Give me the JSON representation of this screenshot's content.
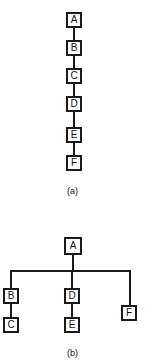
{
  "figure": {
    "background_color": "#ffffff",
    "stroke_color": "#1a1a1a",
    "text_color": "#111111",
    "panels": [
      {
        "id": "a",
        "caption": "(a)",
        "kind": "linear-chain",
        "nodes": [
          {
            "label": "A",
            "x": 66,
            "y": 12,
            "w": 16,
            "h": 16
          },
          {
            "label": "B",
            "x": 66,
            "y": 40,
            "w": 16,
            "h": 16
          },
          {
            "label": "C",
            "x": 66,
            "y": 68,
            "w": 16,
            "h": 16
          },
          {
            "label": "D",
            "x": 66,
            "y": 96,
            "w": 16,
            "h": 16
          },
          {
            "label": "E",
            "x": 66,
            "y": 127,
            "w": 16,
            "h": 16
          },
          {
            "label": "F",
            "x": 66,
            "y": 155,
            "w": 16,
            "h": 16
          }
        ],
        "edges": [
          {
            "from": "A",
            "to": "B",
            "orient": "v",
            "x": 73,
            "y": 28,
            "len": 12
          },
          {
            "from": "B",
            "to": "C",
            "orient": "v",
            "x": 73,
            "y": 56,
            "len": 12
          },
          {
            "from": "C",
            "to": "D",
            "orient": "v",
            "x": 73,
            "y": 84,
            "len": 12
          },
          {
            "from": "D",
            "to": "E",
            "orient": "v",
            "x": 73,
            "y": 112,
            "len": 15
          },
          {
            "from": "E",
            "to": "F",
            "orient": "v",
            "x": 73,
            "y": 143,
            "len": 12
          }
        ],
        "caption_x": 0,
        "caption_y": 186
      },
      {
        "id": "b",
        "caption": "(b)",
        "kind": "tree",
        "nodes": [
          {
            "label": "A",
            "x": 64,
            "y": 32,
            "w": 18,
            "h": 18
          },
          {
            "label": "B",
            "x": 3,
            "y": 83,
            "w": 16,
            "h": 16
          },
          {
            "label": "C",
            "x": 3,
            "y": 112,
            "w": 16,
            "h": 16
          },
          {
            "label": "D",
            "x": 64,
            "y": 83,
            "w": 16,
            "h": 16
          },
          {
            "label": "E",
            "x": 64,
            "y": 112,
            "w": 16,
            "h": 16
          },
          {
            "label": "F",
            "x": 121,
            "y": 100,
            "w": 16,
            "h": 16
          }
        ],
        "edges": [
          {
            "from": "A",
            "to": "bus",
            "orient": "v",
            "x": 72,
            "y": 50,
            "len": 16
          },
          {
            "from": "bus",
            "to": "bus",
            "orient": "h",
            "x": 10,
            "y": 65,
            "len": 121
          },
          {
            "from": "bus",
            "to": "B",
            "orient": "v",
            "x": 10,
            "y": 65,
            "len": 18
          },
          {
            "from": "bus",
            "to": "D",
            "orient": "v",
            "x": 71,
            "y": 65,
            "len": 18
          },
          {
            "from": "bus",
            "to": "F",
            "orient": "v",
            "x": 129,
            "y": 65,
            "len": 35
          },
          {
            "from": "B",
            "to": "C",
            "orient": "v",
            "x": 10,
            "y": 99,
            "len": 13
          },
          {
            "from": "D",
            "to": "E",
            "orient": "v",
            "x": 71,
            "y": 99,
            "len": 13
          }
        ],
        "caption_x": 0,
        "caption_y": 143
      }
    ]
  }
}
